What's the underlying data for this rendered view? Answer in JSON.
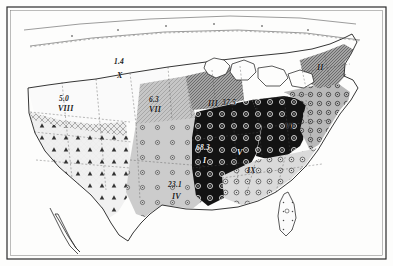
{
  "map": {
    "kind": "thematic-choropleth-map",
    "subject": "United States statistical regions",
    "frame_color": "#2b2b2b",
    "background_color": "#fdfdfc",
    "regions": [
      {
        "id": "X",
        "roman": "X",
        "value": "1.4",
        "x": 118,
        "y": 69,
        "vx": 115,
        "vy": 60,
        "shade": "#ffffff",
        "pattern": "none",
        "label_style": "light"
      },
      {
        "id": "VIII",
        "roman": "VIII",
        "value": "5.0",
        "x": 62,
        "y": 106,
        "vx": 60,
        "vy": 97,
        "shade": "#e6e6e6",
        "pattern": "cross-hatch",
        "label_style": "light"
      },
      {
        "id": "VII",
        "roman": "VII",
        "value": "6.3",
        "x": 152,
        "y": 108,
        "vx": 150,
        "vy": 99,
        "shade": "#bdbdbd",
        "pattern": "fine-hatch",
        "label_style": "light"
      },
      {
        "id": "III",
        "roman": "III",
        "value": "37.5",
        "x": 211,
        "y": 105,
        "vx": 226,
        "vy": 103,
        "shade": "#9a9a9a",
        "pattern": "dense-hatch",
        "label_style": "light"
      },
      {
        "id": "II",
        "roman": "II",
        "value": "",
        "x": 318,
        "y": 68,
        "vx": 0,
        "vy": 0,
        "shade": "#8f8f8f",
        "pattern": "dense-hatch",
        "label_style": "light"
      },
      {
        "id": "I",
        "roman": "I",
        "value": "68.3",
        "x": 204,
        "y": 159,
        "vx": 198,
        "vy": 147,
        "shade": "#141414",
        "pattern": "ring-dark",
        "label_style": "dark"
      },
      {
        "id": "IX",
        "roman": "IX",
        "value": "",
        "x": 249,
        "y": 170,
        "vx": 0,
        "vy": 0,
        "shade": "#d8d8d8",
        "pattern": "open-circles",
        "label_style": "light"
      },
      {
        "id": "IV",
        "roman": "IV",
        "value": "23.1",
        "x": 173,
        "y": 194,
        "vx": 170,
        "vy": 183,
        "shade": "#c8c8c8",
        "pattern": "sparse-circles",
        "label_style": "light"
      },
      {
        "id": "V",
        "roman": "V",
        "value": "",
        "x": 238,
        "y": 151,
        "vx": 0,
        "vy": 0,
        "shade": "#141414",
        "pattern": "ring-dark",
        "label_style": "dark"
      },
      {
        "id": "VI",
        "roman": "VI",
        "value": "",
        "x": 286,
        "y": 126,
        "vx": 0,
        "vy": 0,
        "shade": "#b5b5b5",
        "pattern": "open-circles",
        "label_style": "light"
      }
    ]
  }
}
